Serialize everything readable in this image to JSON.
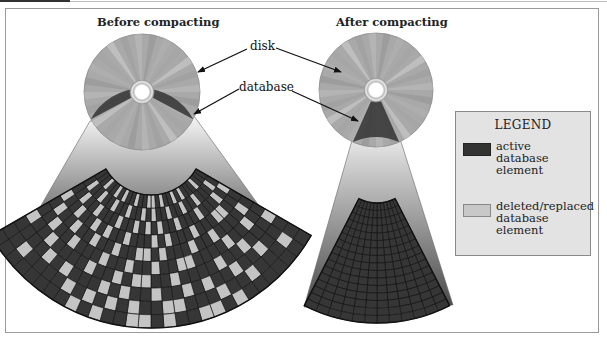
{
  "figure": {
    "before_title": "Before compacting",
    "after_title": "After compacting",
    "callouts": {
      "disk": "disk",
      "database": "database"
    }
  },
  "legend": {
    "title": "LEGEND",
    "items": [
      {
        "label_lines": [
          "active",
          "database",
          "element"
        ],
        "color": "#333333",
        "border": "#222222"
      },
      {
        "label_lines": [
          "deleted/replaced",
          "database",
          "element"
        ],
        "color": "#c8c8c8",
        "border": "#888888"
      }
    ]
  },
  "colors": {
    "active": "#363636",
    "deleted": "#c4c4c4",
    "grid_line": "#151515",
    "disk": "#a9a9a9",
    "disk_db": "#3a3a3a",
    "fan_top": "#f4f4f4",
    "fan_bottom": "#555555",
    "frame": "#9a9a9a",
    "legend_bg": "#e3e3e3"
  },
  "before_grid": {
    "rows": 10,
    "cols": 30,
    "deleted_cells": [
      [
        0,
        3
      ],
      [
        0,
        7
      ],
      [
        0,
        9
      ],
      [
        0,
        12
      ],
      [
        0,
        14
      ],
      [
        0,
        15
      ],
      [
        0,
        18
      ],
      [
        0,
        21
      ],
      [
        0,
        23
      ],
      [
        0,
        26
      ],
      [
        1,
        1
      ],
      [
        1,
        5
      ],
      [
        1,
        8
      ],
      [
        1,
        11
      ],
      [
        1,
        14
      ],
      [
        1,
        16
      ],
      [
        1,
        19
      ],
      [
        1,
        22
      ],
      [
        1,
        25
      ],
      [
        1,
        28
      ],
      [
        2,
        0
      ],
      [
        2,
        2
      ],
      [
        2,
        6
      ],
      [
        2,
        10
      ],
      [
        2,
        13
      ],
      [
        2,
        15
      ],
      [
        2,
        17
      ],
      [
        2,
        20
      ],
      [
        2,
        24
      ],
      [
        2,
        27
      ],
      [
        3,
        3
      ],
      [
        3,
        4
      ],
      [
        3,
        8
      ],
      [
        3,
        12
      ],
      [
        3,
        14
      ],
      [
        3,
        18
      ],
      [
        3,
        21
      ],
      [
        3,
        23
      ],
      [
        3,
        26
      ],
      [
        3,
        29
      ],
      [
        4,
        1
      ],
      [
        4,
        6
      ],
      [
        4,
        9
      ],
      [
        4,
        13
      ],
      [
        4,
        15
      ],
      [
        4,
        16
      ],
      [
        4,
        19
      ],
      [
        4,
        22
      ],
      [
        4,
        25
      ],
      [
        4,
        28
      ],
      [
        5,
        2
      ],
      [
        5,
        5
      ],
      [
        5,
        10
      ],
      [
        5,
        11
      ],
      [
        5,
        14
      ],
      [
        5,
        17
      ],
      [
        5,
        20
      ],
      [
        5,
        24
      ],
      [
        5,
        27
      ],
      [
        6,
        0
      ],
      [
        6,
        4
      ],
      [
        6,
        7
      ],
      [
        6,
        12
      ],
      [
        6,
        15
      ],
      [
        6,
        16
      ],
      [
        6,
        18
      ],
      [
        6,
        21
      ],
      [
        6,
        26
      ],
      [
        6,
        29
      ],
      [
        7,
        3
      ],
      [
        7,
        6
      ],
      [
        7,
        9
      ],
      [
        7,
        11
      ],
      [
        7,
        14
      ],
      [
        7,
        17
      ],
      [
        7,
        19
      ],
      [
        7,
        23
      ],
      [
        7,
        25
      ],
      [
        8,
        1
      ],
      [
        8,
        5
      ],
      [
        8,
        8
      ],
      [
        8,
        12
      ],
      [
        8,
        13
      ],
      [
        8,
        16
      ],
      [
        8,
        18
      ],
      [
        8,
        20
      ],
      [
        8,
        22
      ],
      [
        8,
        27
      ],
      [
        9,
        7
      ],
      [
        9,
        9
      ],
      [
        9,
        10
      ],
      [
        9,
        13
      ],
      [
        9,
        15
      ],
      [
        9,
        16
      ],
      [
        9,
        19
      ],
      [
        9,
        21
      ]
    ]
  },
  "after_grid": {
    "rows": 16,
    "cols": 12,
    "deleted_cells": []
  }
}
